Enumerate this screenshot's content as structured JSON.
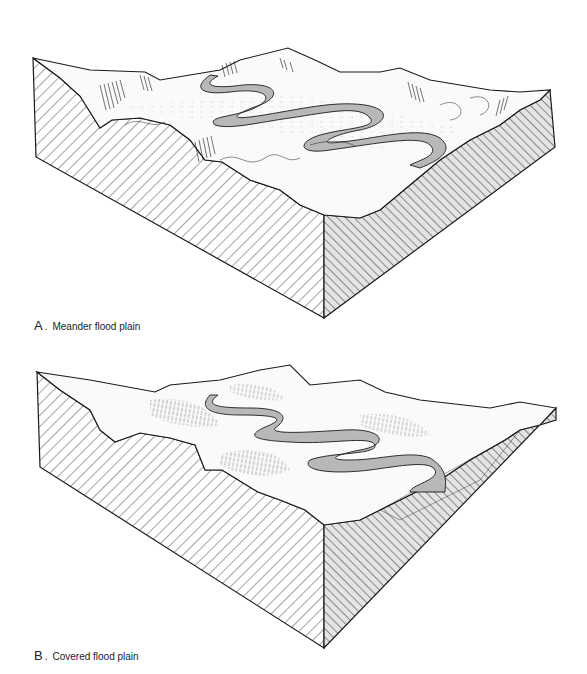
{
  "figures": [
    {
      "id": "A",
      "letter": "A",
      "separator": ".",
      "caption": "Meander flood plain",
      "features": [
        "block-diagram",
        "meandering-river",
        "oxbow-scars",
        "valley-walls",
        "hatched-cross-section"
      ]
    },
    {
      "id": "B",
      "letter": "B",
      "separator": ".",
      "caption": "Covered flood plain",
      "features": [
        "block-diagram",
        "meandering-river",
        "vegetation-cover",
        "valley-walls",
        "hatched-cross-section"
      ]
    }
  ],
  "colors": {
    "line": "#1a1a1a",
    "river_fill": "#b8b8b8",
    "background": "#ffffff"
  }
}
